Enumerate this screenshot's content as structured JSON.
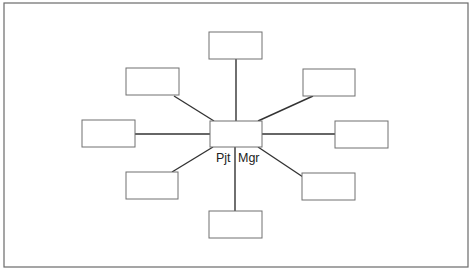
{
  "diagram": {
    "type": "hub-and-spoke",
    "center": {
      "label_left": "Pjt",
      "label_right": "Mgr"
    },
    "spoke_count": 8,
    "spokes": [
      {
        "position": "top",
        "label": ""
      },
      {
        "position": "top-right",
        "label": ""
      },
      {
        "position": "right",
        "label": ""
      },
      {
        "position": "bottom-right",
        "label": ""
      },
      {
        "position": "bottom",
        "label": ""
      },
      {
        "position": "bottom-left",
        "label": ""
      },
      {
        "position": "left",
        "label": ""
      },
      {
        "position": "top-left",
        "label": ""
      }
    ]
  }
}
